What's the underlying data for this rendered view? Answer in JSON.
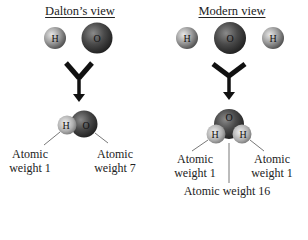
{
  "panels": [
    {
      "title": "Dalton’s view",
      "reactants": [
        {
          "symbol": "H",
          "role": "hydrogen"
        },
        {
          "symbol": "O",
          "role": "oxygen"
        }
      ],
      "product": {
        "atoms": [
          {
            "symbol": "H"
          },
          {
            "symbol": "O"
          }
        ],
        "labels": [
          {
            "line1": "Atomic",
            "line2": "weight 1"
          },
          {
            "line1": "Atomic",
            "line2": "weight 7"
          }
        ]
      }
    },
    {
      "title": "Modern view",
      "reactants": [
        {
          "symbol": "H",
          "role": "hydrogen"
        },
        {
          "symbol": "O",
          "role": "oxygen"
        },
        {
          "symbol": "H",
          "role": "hydrogen"
        }
      ],
      "product": {
        "atoms": [
          {
            "symbol": "O"
          },
          {
            "symbol": "H"
          },
          {
            "symbol": "H"
          }
        ],
        "labels": [
          {
            "line1": "Atomic",
            "line2": "weight 1"
          },
          {
            "line1": "Atomic",
            "line2": "weight 1"
          },
          {
            "line1": "Atomic weight 16",
            "line2": ""
          }
        ]
      }
    }
  ],
  "colors": {
    "hydrogen": "#9a9a9a",
    "oxygen": "#4a4a4a",
    "arrow": "#111111",
    "background": "#ffffff"
  }
}
